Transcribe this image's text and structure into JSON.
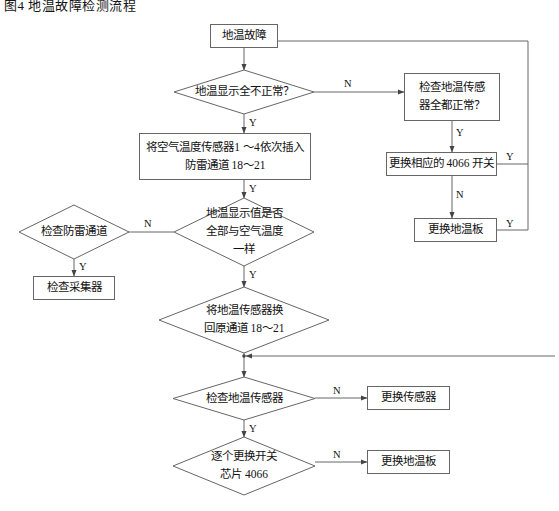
{
  "title": "图4 地温故障检测流程",
  "colors": {
    "line": "#666666",
    "box_border": "#666666",
    "text": "#111111",
    "background": "#ffffff"
  },
  "diagram": {
    "type": "flowchart",
    "orientation": "top-to-bottom",
    "nodes": [
      {
        "id": "n1",
        "shape": "rect",
        "label": "地温故障"
      },
      {
        "id": "n2",
        "shape": "diamond",
        "label": "地温显示全不正常？"
      },
      {
        "id": "n3",
        "shape": "rect",
        "label": "检查地温传感\n器全都正常？"
      },
      {
        "id": "n4",
        "shape": "rect",
        "label": "更换相应的 4066 开关"
      },
      {
        "id": "n5",
        "shape": "rect",
        "label": "更换地温板"
      },
      {
        "id": "n6",
        "shape": "rect",
        "label": "将空气温度传感器1 ～4依次插入\n防雷通道 18～21"
      },
      {
        "id": "n7",
        "shape": "diamond",
        "label": "地温显示值是否\n全部与空气温度\n一样"
      },
      {
        "id": "n8",
        "shape": "diamond",
        "label": "检查防雷通道"
      },
      {
        "id": "n9",
        "shape": "rect",
        "label": "检查采集器"
      },
      {
        "id": "n10",
        "shape": "diamond",
        "label": "将地温传感器换\n回原通道 18～21"
      },
      {
        "id": "n11",
        "shape": "diamond",
        "label": "检查地温传感器"
      },
      {
        "id": "n12",
        "shape": "rect",
        "label": "更换传感器"
      },
      {
        "id": "n13",
        "shape": "diamond",
        "label": "逐个更换开关\n芯片 4066"
      },
      {
        "id": "n14",
        "shape": "rect",
        "label": "更换地温板"
      }
    ],
    "edges": [
      {
        "from": "n1",
        "to": "n2",
        "label": ""
      },
      {
        "from": "n2",
        "to": "n3",
        "label": "N"
      },
      {
        "from": "n2",
        "to": "n6",
        "label": "Y"
      },
      {
        "from": "n3",
        "to": "n4",
        "label": "Y"
      },
      {
        "from": "n4",
        "to": "n5",
        "label": "N"
      },
      {
        "from": "n4",
        "to": "n1",
        "label": "Y"
      },
      {
        "from": "n5",
        "to": "n1",
        "label": "Y"
      },
      {
        "from": "n6",
        "to": "n7",
        "label": "Y"
      },
      {
        "from": "n7",
        "to": "n8",
        "label": "N"
      },
      {
        "from": "n7",
        "to": "n10",
        "label": "Y"
      },
      {
        "from": "n8",
        "to": "n9",
        "label": "Y"
      },
      {
        "from": "n10",
        "to": "n11",
        "label": ""
      },
      {
        "from": "n11",
        "to": "n12",
        "label": "N"
      },
      {
        "from": "n11",
        "to": "n13",
        "label": "Y"
      },
      {
        "from": "n13",
        "to": "n14",
        "label": "N"
      }
    ],
    "edge_labels": [
      {
        "id": "L1",
        "text": "N"
      },
      {
        "id": "L2",
        "text": "Y"
      },
      {
        "id": "L3",
        "text": "Y"
      },
      {
        "id": "L4",
        "text": "Y"
      },
      {
        "id": "L5",
        "text": "N"
      },
      {
        "id": "L6",
        "text": "Y"
      },
      {
        "id": "L7",
        "text": "Y"
      },
      {
        "id": "L8",
        "text": "N"
      },
      {
        "id": "L9",
        "text": "Y"
      },
      {
        "id": "L10",
        "text": "Y"
      },
      {
        "id": "L11",
        "text": "N"
      },
      {
        "id": "L12",
        "text": "Y"
      },
      {
        "id": "L13",
        "text": "N"
      }
    ]
  }
}
